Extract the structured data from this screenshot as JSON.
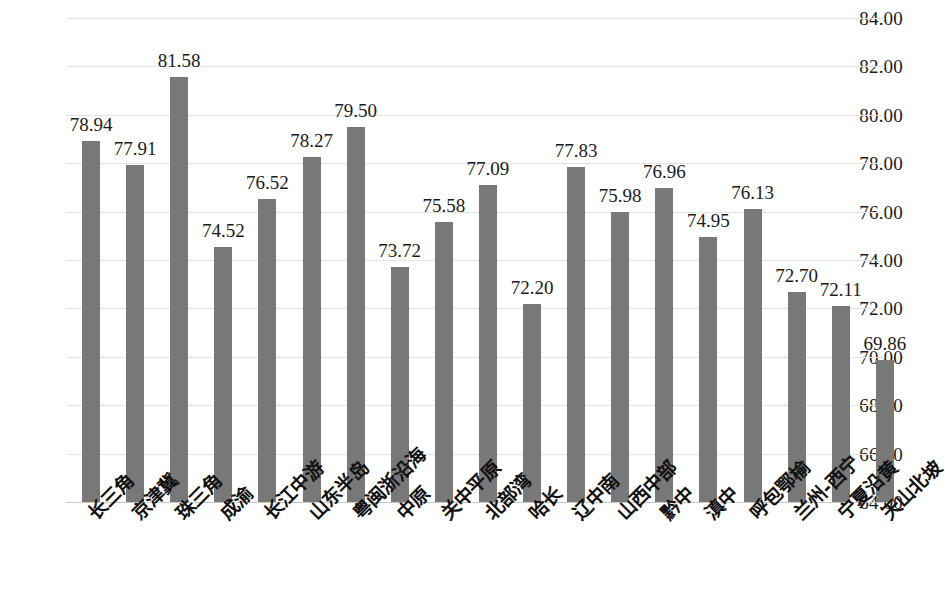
{
  "chart_data": {
    "type": "bar",
    "title": "",
    "subtitle": "",
    "xlabel": "",
    "ylabel": "",
    "ylim": [
      64.0,
      84.0
    ],
    "ytick_step": 2.0,
    "ytick_labels": [
      "84.00",
      "82.00",
      "80.00",
      "78.00",
      "76.00",
      "74.00",
      "72.00",
      "70.00",
      "68.00",
      "66.00",
      "64.00"
    ],
    "ytick_values": [
      84.0,
      82.0,
      80.0,
      78.0,
      76.0,
      74.0,
      72.0,
      70.0,
      68.0,
      66.0,
      64.0
    ],
    "grid": true,
    "legend": false,
    "legend_position": "none",
    "bar_color": "#787878",
    "gridline_color": "#e3e3e3",
    "text_color": "#1a1a1a",
    "categories": [
      "长三角",
      "京津冀",
      "珠三角",
      "成渝",
      "长江中游",
      "山东半岛",
      "粤闽浙沿海",
      "中原",
      "关中平原",
      "北部湾",
      "哈长",
      "辽中南",
      "山西中部",
      "黔中",
      "滇中",
      "呼包鄂榆",
      "兰州-西宁",
      "宁夏沿黄",
      "天山北坡"
    ],
    "values": [
      78.94,
      77.91,
      81.58,
      74.52,
      76.52,
      78.27,
      79.5,
      73.72,
      75.58,
      77.09,
      72.2,
      77.83,
      75.98,
      76.96,
      74.95,
      76.13,
      72.7,
      72.11,
      69.86
    ],
    "value_labels": [
      "78.94",
      "77.91",
      "81.58",
      "74.52",
      "76.52",
      "78.27",
      "79.50",
      "73.72",
      "75.58",
      "77.09",
      "72.20",
      "77.83",
      "75.98",
      "76.96",
      "74.95",
      "76.13",
      "72.70",
      "72.11",
      "69.86"
    ],
    "series": [
      {
        "name": "",
        "values": [
          78.94,
          77.91,
          81.58,
          74.52,
          76.52,
          78.27,
          79.5,
          73.72,
          75.58,
          77.09,
          72.2,
          77.83,
          75.98,
          76.96,
          74.95,
          76.13,
          72.7,
          72.11,
          69.86
        ]
      }
    ]
  }
}
